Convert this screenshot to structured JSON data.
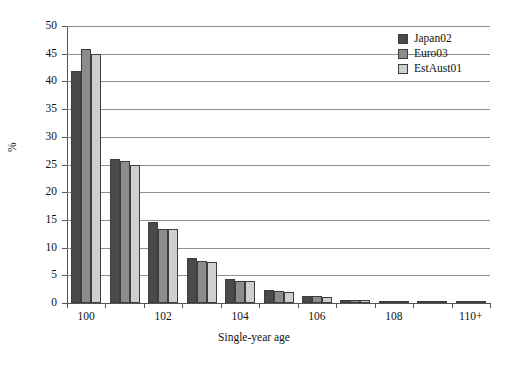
{
  "chart_data": {
    "type": "bar",
    "title": "",
    "xlabel": "Single-year age",
    "ylabel": "%",
    "ylim": [
      0,
      50
    ],
    "ytick_step": 5,
    "yticks": [
      0,
      5,
      10,
      15,
      20,
      25,
      30,
      35,
      40,
      45,
      50
    ],
    "ytick_labels": [
      "0",
      "5",
      "10",
      "15",
      "20",
      "25",
      "30",
      "35",
      "40",
      "45",
      "50"
    ],
    "grid": "horizontal",
    "legend_position": "top-right",
    "categories": [
      "100",
      "101",
      "102",
      "103",
      "104",
      "105",
      "106",
      "107",
      "108",
      "109",
      "110+"
    ],
    "xtick_labels": [
      "100",
      "102",
      "104",
      "106",
      "108",
      "110+"
    ],
    "series": [
      {
        "name": "Japan02",
        "color": "#4a4a4a",
        "values": [
          41.8,
          26.0,
          14.6,
          8.2,
          4.4,
          2.4,
          1.3,
          0.6,
          0.35,
          0.2,
          0.15
        ]
      },
      {
        "name": "Euro03",
        "color": "#8c8c8c",
        "values": [
          45.8,
          25.6,
          13.4,
          7.5,
          4.0,
          2.1,
          1.2,
          0.55,
          0.3,
          0.15,
          0.1
        ]
      },
      {
        "name": "EstAust01",
        "color": "#cfcfcf",
        "values": [
          45.0,
          25.0,
          13.3,
          7.4,
          3.9,
          2.0,
          1.1,
          0.5,
          0.25,
          0.12,
          0.08
        ]
      }
    ]
  },
  "legend": {
    "items": [
      {
        "label": "Japan02"
      },
      {
        "label": "Euro03"
      },
      {
        "label": "EstAust01"
      }
    ]
  },
  "axes": {
    "y_title": "%",
    "x_title": "Single-year age"
  }
}
